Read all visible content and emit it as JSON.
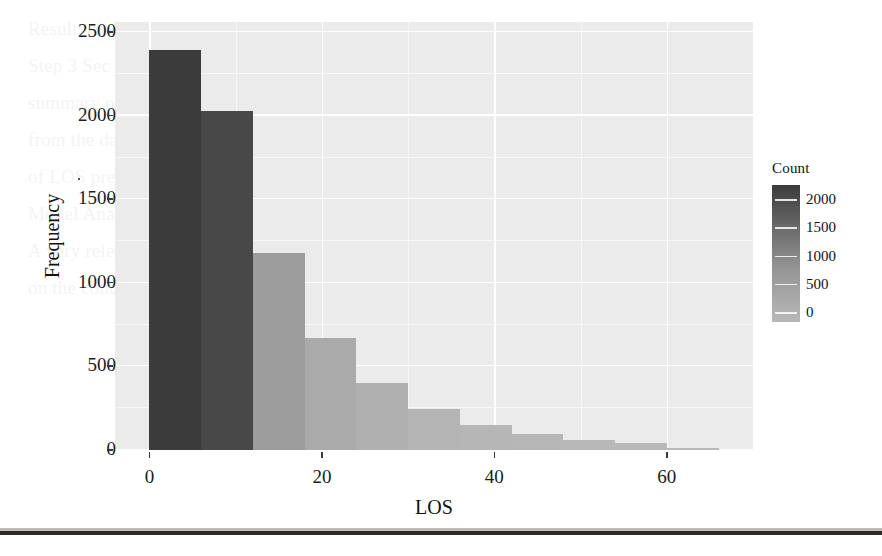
{
  "figure": {
    "panel_background": "#ebebeb",
    "grid_color": "#ffffff"
  },
  "axis": {
    "x_title": "LOS",
    "y_title": "Frequency",
    "x_ticks": [
      "0",
      "20",
      "40",
      "60"
    ],
    "y_ticks": [
      "0",
      "500",
      "1000",
      "1500",
      "2000",
      "2500"
    ]
  },
  "legend": {
    "title": "Count",
    "ticks": [
      "2000",
      "1500",
      "1000",
      "500",
      "0"
    ],
    "high_color": "#3b3b3b",
    "low_color": "#b8b8b8",
    "trailing_dot": "."
  },
  "chart_data": {
    "type": "bar",
    "title": "",
    "subtitle": "",
    "xlabel": "LOS",
    "ylabel": "Frequency",
    "xlim": [
      -4,
      70
    ],
    "ylim": [
      0,
      2560
    ],
    "grid": true,
    "legend_position": "right",
    "legend_title": "Count",
    "colormap": "grey-continuous-dark-high",
    "bin_width": 6,
    "bins": [
      {
        "x_start": 0,
        "x_end": 6,
        "x_center": 3,
        "value": 2390,
        "color": "#3b3b3b"
      },
      {
        "x_start": 6,
        "x_end": 12,
        "x_center": 9,
        "value": 2030,
        "color": "#484848"
      },
      {
        "x_start": 12,
        "x_end": 18,
        "x_center": 15,
        "value": 1180,
        "color": "#9d9d9d"
      },
      {
        "x_start": 18,
        "x_end": 24,
        "x_center": 21,
        "value": 670,
        "color": "#aaaaaa"
      },
      {
        "x_start": 24,
        "x_end": 30,
        "x_center": 27,
        "value": 400,
        "color": "#b0b0b0"
      },
      {
        "x_start": 30,
        "x_end": 36,
        "x_center": 33,
        "value": 245,
        "color": "#b4b4b4"
      },
      {
        "x_start": 36,
        "x_end": 42,
        "x_center": 39,
        "value": 150,
        "color": "#b6b6b6"
      },
      {
        "x_start": 42,
        "x_end": 48,
        "x_center": 45,
        "value": 95,
        "color": "#b7b7b7"
      },
      {
        "x_start": 48,
        "x_end": 54,
        "x_center": 51,
        "value": 62,
        "color": "#b8b8b8"
      },
      {
        "x_start": 54,
        "x_end": 60,
        "x_center": 57,
        "value": 40,
        "color": "#b8b8b8"
      },
      {
        "x_start": 60,
        "x_end": 66,
        "x_center": 63,
        "value": 12,
        "color": "#b9b9b9"
      }
    ],
    "categories": [
      3,
      9,
      15,
      21,
      27,
      33,
      39,
      45,
      51,
      57,
      63
    ],
    "values": [
      2390,
      2030,
      1180,
      670,
      400,
      245,
      150,
      95,
      62,
      40,
      12
    ]
  },
  "bleed_text": [
    "",
    "Results and Findings",
    "Step 3 Sec",
    "summary of the LOS predictor      vs      predicted distribution",
    "from the     data to      data classification on",
    "",
    "of  LOS      predictions",
    "",
    "",
    "",
    "",
    "Model Analysis",
    "A very relevant aspect in the   analysis  is the  of the",
    "on the    concerning  a  of the  from the",
    "number of  patients   and   million  on  to"
  ]
}
